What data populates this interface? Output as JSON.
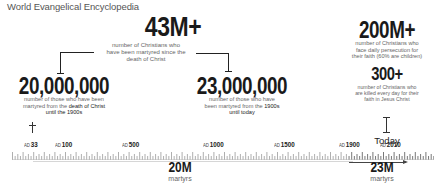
{
  "source": "World Evangelical Encyclopedia",
  "stats": {
    "total": {
      "value": "43M+",
      "description_lines": [
        "number of Christians who",
        "have been martyred since the",
        "death of Christ"
      ]
    },
    "early": {
      "value": "20,000,000",
      "description_lines": [
        "number of those who have been",
        "martyred from the",
        "death of Christ",
        "until the 1900s"
      ]
    },
    "modern": {
      "value": "23,000,000",
      "description_lines": [
        "number of those who have",
        "been martyred from the",
        "1900s",
        "until today"
      ]
    },
    "persecuted": {
      "value": "200M+",
      "description_lines": [
        "number of Christians who",
        "face daily persecution for",
        "their faith (60% are children)"
      ]
    },
    "daily": {
      "value": "300+",
      "description_lines": [
        "number of Christians who",
        "are killed every day for their",
        "faith in Jesus Christ"
      ]
    }
  },
  "timeline": {
    "today_label": "Today",
    "ad_prefix": "AD",
    "markers": [
      {
        "prefix": "AD",
        "year": "33"
      },
      {
        "prefix": "AD",
        "year": "100"
      },
      {
        "prefix": "AD",
        "year": "500"
      },
      {
        "prefix": "AD",
        "year": "1000"
      },
      {
        "prefix": "AD",
        "year": "1500"
      },
      {
        "prefix": "AD",
        "year": "1900"
      },
      {
        "prefix": "AD",
        "year": "2010"
      }
    ],
    "segments": [
      {
        "value": "20M",
        "label": "martyrs",
        "range": "AD 33 – AD 1900"
      },
      {
        "value": "23M",
        "label": "martyrs",
        "range": "AD 1900 – Today"
      }
    ]
  },
  "icons": {
    "start": "cross-icon",
    "end": "today-marker-icon"
  },
  "colors": {
    "text_primary": "#1a1a1a",
    "text_secondary": "#666666",
    "ruler": "#9a9a9a",
    "ruler_recent": "#555555",
    "underline": "#d6d6d6"
  }
}
